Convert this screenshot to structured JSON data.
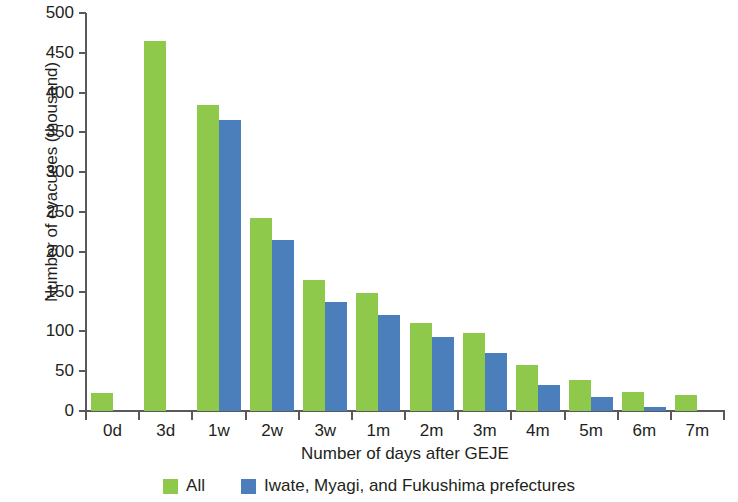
{
  "chart_data": {
    "type": "bar",
    "title": "",
    "xlabel": "Number of days after GEJE",
    "ylabel": "Number of evacuees (thousand)",
    "ylim": [
      0,
      500
    ],
    "yticks": [
      0,
      50,
      100,
      150,
      200,
      250,
      300,
      350,
      400,
      450,
      500
    ],
    "grid": false,
    "legend_position": "bottom",
    "categories": [
      "0d",
      "3d",
      "1w",
      "2w",
      "3w",
      "1m",
      "2m",
      "3m",
      "4m",
      "5m",
      "6m",
      "7m"
    ],
    "series": [
      {
        "name": "All",
        "color": "#8fc94c",
        "values": [
          23,
          465,
          385,
          243,
          164,
          148,
          110,
          98,
          58,
          39,
          24,
          20
        ]
      },
      {
        "name": "Iwate, Myagi, and Fukushima prefectures",
        "color": "#4a7fbc",
        "values": [
          null,
          null,
          365,
          215,
          137,
          121,
          93,
          73,
          33,
          18,
          5,
          null
        ]
      }
    ]
  },
  "legend": {
    "items": [
      {
        "label": "All",
        "color": "#8fc94c",
        "swatch": "green-swatch-icon"
      },
      {
        "label": "Iwate, Myagi, and Fukushima prefectures",
        "color": "#4a7fbc",
        "swatch": "blue-swatch-icon"
      }
    ]
  },
  "axis": {
    "y_title": "Number of evacuees (thousand)",
    "x_title": "Number of days after GEJE"
  }
}
